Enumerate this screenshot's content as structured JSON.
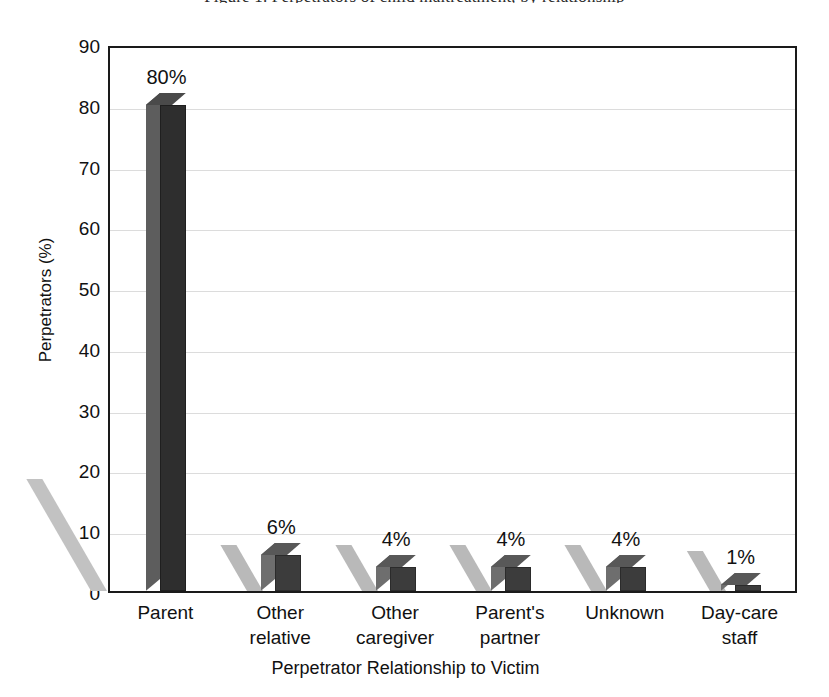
{
  "figure": {
    "top_caption_fragment": "Figure 1. Perpetrators of child maltreatment, by relationship"
  },
  "chart_data": {
    "type": "bar",
    "title": "",
    "xlabel": "Perpetrator Relationship to Victim",
    "ylabel": "Perpetrators (%)",
    "categories": [
      "Parent",
      "Other relative",
      "Other caregiver",
      "Parent's partner",
      "Unknown",
      "Day-care staff"
    ],
    "category_lines": [
      [
        "Parent"
      ],
      [
        "Other",
        "relative"
      ],
      [
        "Other",
        "caregiver"
      ],
      [
        "Parent's",
        "partner"
      ],
      [
        "Unknown"
      ],
      [
        "Day-care",
        "staff"
      ]
    ],
    "values": [
      80,
      6,
      4,
      4,
      4,
      1
    ],
    "data_labels": [
      "80%",
      "6%",
      "4%",
      "4%",
      "4%",
      "1%"
    ],
    "ylim": [
      0,
      90
    ],
    "yticks": [
      0,
      10,
      20,
      30,
      40,
      50,
      60,
      70,
      80,
      90
    ],
    "ytick_labels": [
      "0",
      "10",
      "20",
      "30",
      "40",
      "50",
      "60",
      "70",
      "80",
      "90"
    ],
    "grid": true,
    "grid_axis": "y",
    "legend": false,
    "style": "3d-bar",
    "colors": {
      "bar_front": "#3c3c3c",
      "bar_side": "#6e6e6e",
      "bar_top": "#585858",
      "bar_projection": "#b9b9b9",
      "gridline": "#dcdcdc",
      "axis": "#1a1a1a",
      "text": "#111111",
      "background": "#ffffff"
    }
  }
}
